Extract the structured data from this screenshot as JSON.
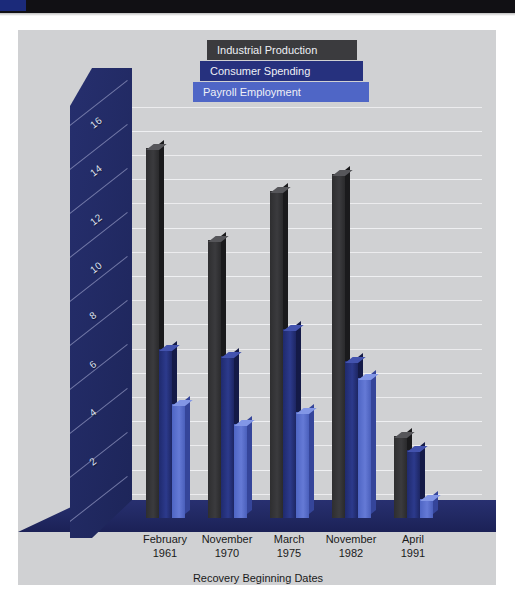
{
  "page": {
    "background": "#ffffff",
    "panel_background": "#d0d1d3",
    "top_band_color": "#111014",
    "top_band_accent_color": "#1b2a7a"
  },
  "chart_data": {
    "type": "bar",
    "title": "",
    "subtitle": "",
    "xlabel": "Recovery Beginning Dates",
    "ylabel": "",
    "grid": true,
    "legend_position": "top-center",
    "ylim": [
      0,
      17
    ],
    "yticks": [
      2,
      4,
      6,
      8,
      10,
      12,
      14,
      16
    ],
    "categories": [
      "February\n1961",
      "November\n1970",
      "March\n1975",
      "November\n1982",
      "April\n1991"
    ],
    "category_lines": [
      [
        "February",
        "1961"
      ],
      [
        "November",
        "1970"
      ],
      [
        "March",
        "1975"
      ],
      [
        "November",
        "1982"
      ],
      [
        "April",
        "1991"
      ]
    ],
    "series": [
      {
        "name": "Industrial Production",
        "color": "#3b3b3e",
        "values": [
          15.3,
          11.5,
          13.5,
          14.2,
          3.4
        ]
      },
      {
        "name": "Consumer Spending",
        "color": "#26317e",
        "values": [
          7.0,
          6.7,
          7.8,
          6.5,
          2.8
        ]
      },
      {
        "name": "Payroll Employment",
        "color": "#4f66c6",
        "values": [
          4.7,
          3.9,
          4.4,
          5.8,
          0.8
        ]
      }
    ]
  },
  "axis": {
    "y_tick_labels": [
      "16",
      "14",
      "12",
      "10",
      "8",
      "6",
      "4",
      "2"
    ],
    "x_title": "Recovery Beginning Dates"
  },
  "legend": {
    "items": [
      {
        "label": "Industrial Production",
        "color": "#3b3b3e"
      },
      {
        "label": "Consumer Spending",
        "color": "#26317e"
      },
      {
        "label": "Payroll Employment",
        "color": "#4f66c6"
      }
    ]
  }
}
